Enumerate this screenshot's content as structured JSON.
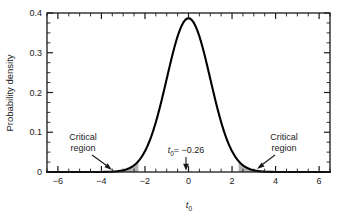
{
  "chart_data": {
    "type": "line",
    "title": "",
    "xlabel": "t0",
    "ylabel": "Probability density",
    "xlim": [
      -6.5,
      6.5
    ],
    "ylim": [
      0,
      0.4
    ],
    "grid": false,
    "legend_position": "none",
    "x_ticks_major": [
      -6,
      -4,
      -2,
      0,
      2,
      4,
      6
    ],
    "x_tick_labels": [
      "−6",
      "−4",
      "−2",
      "0",
      "2",
      "4",
      "6"
    ],
    "x_tick_minor_step": 0.5,
    "y_ticks_major": [
      0,
      0.1,
      0.2,
      0.3,
      0.4
    ],
    "y_tick_labels": [
      "0",
      "0.1",
      "0.2",
      "0.3",
      "0.4"
    ],
    "y_tick_minor_step": 0.025,
    "curve_name": "t distribution probability density",
    "peak_value": 0.3867,
    "peak_x": 0,
    "series": [
      {
        "name": "probability density",
        "x": [
          -6.5,
          -6.0,
          -5.5,
          -5.0,
          -4.5,
          -4.0,
          -3.5,
          -3.25,
          -3.0,
          -2.75,
          -2.5,
          -2.25,
          -2.0,
          -1.75,
          -1.5,
          -1.25,
          -1.0,
          -0.75,
          -0.5,
          -0.25,
          0,
          0.25,
          0.5,
          0.75,
          1.0,
          1.25,
          1.5,
          1.75,
          2.0,
          2.25,
          2.5,
          2.75,
          3.0,
          3.25,
          3.5,
          4.0,
          4.5,
          5.0,
          5.5,
          6.0,
          6.5
        ],
        "values": [
          0.0,
          0.0001,
          0.0002,
          0.0005,
          0.0013,
          0.0034,
          0.0088,
          0.0136,
          0.0207,
          0.0307,
          0.044,
          0.0612,
          0.082,
          0.1057,
          0.131,
          0.1561,
          0.179,
          0.1977,
          0.2106,
          0.2171,
          0.2193,
          0.2171,
          0.2106,
          0.1977,
          0.179,
          0.1561,
          0.131,
          0.1057,
          0.082,
          0.0612,
          0.044,
          0.0307,
          0.0207,
          0.0136,
          0.0088,
          0.0034,
          0.0013,
          0.0005,
          0.0002,
          0.0001,
          0.0
        ]
      }
    ],
    "shaded_regions": [
      {
        "name": "left critical region",
        "x_from": -3.05,
        "x_to": -2.3,
        "color": "#b3b3b3"
      },
      {
        "name": "right critical region",
        "x_from": 2.3,
        "x_to": 3.05,
        "color": "#b3b3b3"
      }
    ],
    "annotations": [
      {
        "name": "left-critical-region-label",
        "line1": "Critical",
        "line2": "region",
        "points_to_x": -2.45
      },
      {
        "name": "right-critical-region-label",
        "line1": "Critical",
        "line2": "region",
        "points_to_x": 2.55
      },
      {
        "name": "test-statistic-label",
        "text": "t0 = −0.26",
        "value": -0.26,
        "points_to_x": -0.26
      }
    ]
  },
  "labels": {
    "y_axis_title": "Probability density",
    "x_axis_symbol": "t",
    "x_axis_subscript": "0",
    "critical_line1": "Critical",
    "critical_line2": "region",
    "t0_symbol": "t",
    "t0_subscript": "0",
    "t0_equals": "= −0.26"
  },
  "colors": {
    "curve": "#000000",
    "axis": "#1a1a1a",
    "shading": "#b3b3b3",
    "background": "#ffffff"
  }
}
